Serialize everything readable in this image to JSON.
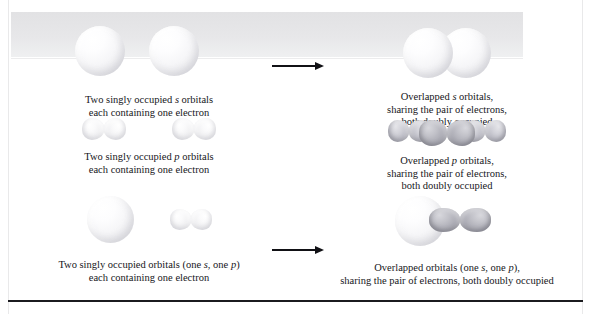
{
  "figure": {
    "arrow_symbol": "right-arrow"
  },
  "colors": {
    "page_background": "#ffffff",
    "banner_band": "#e4e4e7",
    "bottom_rule": "#1b1b1f",
    "edge_rule": "#e9e9ea",
    "text": "#16161a",
    "arrow": "#111115",
    "orbital_pale": "#f2f2f5",
    "orbital_dark": "#9a9aa4"
  },
  "rows": [
    {
      "id": "s-s",
      "left": {
        "art": "two-separate-s-spheres",
        "caption_lines": [
          {
            "parts": [
              {
                "t": "Two singly occupied "
              },
              {
                "t": "s",
                "i": true
              },
              {
                "t": " orbitals"
              }
            ]
          },
          {
            "parts": [
              {
                "t": "each containing one electron"
              }
            ]
          }
        ]
      },
      "arrow": "→",
      "right": {
        "art": "two-overlapped-s-spheres",
        "caption_lines": [
          {
            "parts": [
              {
                "t": "Overlapped "
              },
              {
                "t": "s",
                "i": true
              },
              {
                "t": " orbitals,"
              }
            ]
          },
          {
            "parts": [
              {
                "t": "sharing the pair of electrons,"
              }
            ]
          },
          {
            "parts": [
              {
                "t": "both doubly occupied"
              }
            ]
          }
        ]
      }
    },
    {
      "id": "p-p",
      "left": {
        "art": "two-separate-p-dumbbells",
        "caption_lines": [
          {
            "parts": [
              {
                "t": "Two singly occupied "
              },
              {
                "t": "p",
                "i": true
              },
              {
                "t": " orbitals"
              }
            ]
          },
          {
            "parts": [
              {
                "t": "each containing one electron"
              }
            ]
          }
        ]
      },
      "arrow": "→",
      "right": {
        "art": "overlapped-p-dumbbells",
        "caption_lines": [
          {
            "parts": [
              {
                "t": "Overlapped "
              },
              {
                "t": "p",
                "i": true
              },
              {
                "t": " orbitals,"
              }
            ]
          },
          {
            "parts": [
              {
                "t": "sharing the pair of electrons,"
              }
            ]
          },
          {
            "parts": [
              {
                "t": "both doubly occupied"
              }
            ]
          }
        ]
      }
    },
    {
      "id": "s-p",
      "left": {
        "art": "separate-s-sphere-and-p-dumbbell",
        "caption_lines": [
          {
            "parts": [
              {
                "t": "Two singly occupied orbitals (one "
              },
              {
                "t": "s",
                "i": true
              },
              {
                "t": ", one "
              },
              {
                "t": "p",
                "i": true
              },
              {
                "t": ")"
              }
            ]
          },
          {
            "parts": [
              {
                "t": "each containing one electron"
              }
            ]
          }
        ]
      },
      "arrow": "→",
      "right": {
        "art": "overlapped-s-sphere-and-p-dumbbell",
        "caption_lines": [
          {
            "parts": [
              {
                "t": "Overlapped orbitals (one "
              },
              {
                "t": "s",
                "i": true
              },
              {
                "t": ", one "
              },
              {
                "t": "p",
                "i": true
              },
              {
                "t": "),"
              }
            ]
          },
          {
            "parts": [
              {
                "t": "sharing the pair of electrons, both doubly occupied"
              }
            ]
          }
        ]
      }
    }
  ]
}
